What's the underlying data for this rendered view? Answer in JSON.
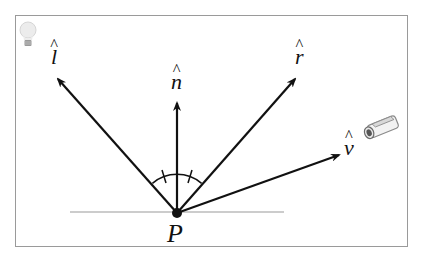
{
  "diagram": {
    "type": "phong-reflection-vectors",
    "labels": {
      "light": "l",
      "normal": "n",
      "reflection": "r",
      "view": "v",
      "point": "P"
    },
    "icons": {
      "light_source": "lightbulb-icon",
      "viewer": "camera-icon"
    },
    "colors": {
      "arrow": "#111111",
      "surface": "#bbbbbb",
      "frame": "#9a9a9a"
    },
    "points": {
      "P": [
        177,
        213
      ],
      "l_tip": [
        57,
        78
      ],
      "n_tip": [
        177,
        102
      ],
      "r_tip": [
        296,
        78
      ],
      "v_tip": [
        340,
        155
      ]
    }
  }
}
